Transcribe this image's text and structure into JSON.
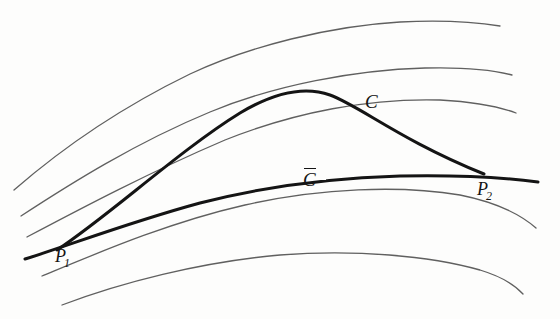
{
  "figure": {
    "kind": "hand-drawn-mathematical-diagram",
    "background_color": "#fdfdfc",
    "ink_color": "#2b2b2b",
    "bold_ink_color": "#141414",
    "width": 560,
    "height": 319
  },
  "labels": [
    {
      "id": "C",
      "text": "C",
      "x": 365,
      "y": 92,
      "name": "curve-c-label"
    },
    {
      "id": "Cb",
      "text": "C",
      "x": 303,
      "y": 170,
      "name": "curve-c-bar-label"
    },
    {
      "id": "P1",
      "text": "P",
      "sub": "1",
      "x": 55,
      "y": 247,
      "name": "point-p1-label"
    },
    {
      "id": "P2",
      "text": "P",
      "sub": "2",
      "x": 477,
      "y": 180,
      "name": "point-p2-label"
    }
  ],
  "curves": {
    "field": [
      {
        "name": "field-curve-1",
        "role": "uppermost background extremal",
        "d": "M 14 190 C 60 150, 120 108, 190 74 C 250 46, 330 26, 400 22 C 440 20, 475 22, 500 26"
      },
      {
        "name": "field-curve-2",
        "role": "second background extremal",
        "d": "M 21 216 C 70 184, 135 143, 210 112 C 275 85, 355 70, 425 68 C 465 67, 493 70, 512 75"
      },
      {
        "name": "field-curve-3",
        "role": "third background extremal, tangent to C at apex",
        "d": "M 27 237 C 80 209, 150 172, 225 140 C 295 112, 370 98, 440 100 C 475 102, 500 107, 516 113"
      },
      {
        "name": "field-curve-4",
        "role": "lower background extremal",
        "d": "M 42 276 C 100 252, 170 222, 245 205 C 320 188, 400 185, 460 195 C 495 202, 520 214, 536 228"
      },
      {
        "name": "field-curve-5",
        "role": "lowest background extremal",
        "d": "M 62 305 C 120 283, 200 262, 280 255 C 355 249, 430 256, 480 270 C 503 277, 515 285, 523 294"
      }
    ],
    "highlighted": [
      {
        "name": "curve-c-bar",
        "label": "C̄",
        "role": "lower bold extremal from P1 through to right edge",
        "d": "M 25 259 C 70 245, 130 222, 200 203 C 262 187, 330 178, 400 176 C 450 175, 500 177, 538 182"
      },
      {
        "name": "curve-c",
        "label": "C",
        "role": "upper bold arc from P1 over apex down to P2",
        "d": "M 57 250 C 110 215, 180 150, 240 113 C 275 92, 305 86, 330 95 C 360 106, 400 140, 484 174"
      }
    ]
  },
  "points": [
    {
      "name": "point-p1",
      "label": "P1",
      "x": 57,
      "y": 250
    },
    {
      "name": "point-p2",
      "label": "P2",
      "x": 484,
      "y": 174
    }
  ]
}
